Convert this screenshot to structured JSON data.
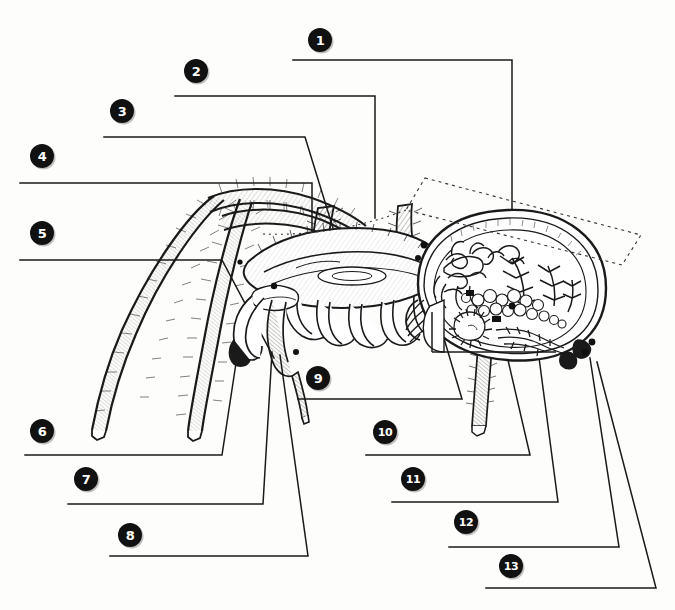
{
  "page": {
    "kind": "anatomy-worksheet",
    "background_color": "#fdfdfc",
    "ink_color": "#111111",
    "width": 675,
    "height": 610
  },
  "markers": [
    {
      "id": 1,
      "label": "1",
      "x": 320,
      "y": 40,
      "line": {
        "x1": 293,
        "x2": 512,
        "y": 60,
        "vx": 512,
        "vy": 245
      }
    },
    {
      "id": 2,
      "label": "2",
      "x": 196,
      "y": 71,
      "line": {
        "x1": 175,
        "x2": 375,
        "y": 96,
        "vx": 375,
        "vy": 218
      }
    },
    {
      "id": 3,
      "label": "3",
      "x": 122,
      "y": 111,
      "line": {
        "x1": 104,
        "x2": 305,
        "y": 137,
        "vx": 333,
        "vy": 228
      }
    },
    {
      "id": 4,
      "label": "4",
      "x": 42,
      "y": 156,
      "line": {
        "x1": 20,
        "x2": 312,
        "y": 183,
        "vx": 312,
        "vy": 232
      }
    },
    {
      "id": 5,
      "label": "5",
      "x": 42,
      "y": 233,
      "line": {
        "x1": 20,
        "x2": 222,
        "y": 260,
        "vx": 274,
        "vy": 358
      }
    },
    {
      "id": 6,
      "label": "6",
      "x": 42,
      "y": 431,
      "line": {
        "x1": 25,
        "x2": 222,
        "y": 455,
        "vx": 238,
        "vy": 350
      }
    },
    {
      "id": 7,
      "label": "7",
      "x": 86,
      "y": 479,
      "line": {
        "x1": 68,
        "x2": 263,
        "y": 504,
        "vx": 272,
        "vy": 352
      }
    },
    {
      "id": 8,
      "label": "8",
      "x": 130,
      "y": 535,
      "line": {
        "x1": 110,
        "x2": 308,
        "y": 556,
        "vx": 280,
        "vy": 355
      }
    },
    {
      "id": 9,
      "label": "9",
      "x": 318,
      "y": 378,
      "line": {
        "x1": 298,
        "x2": 462,
        "y": 399,
        "vx": 426,
        "vy": 278
      }
    },
    {
      "id": 10,
      "label": "10",
      "x": 385,
      "y": 432,
      "line": {
        "x1": 366,
        "x2": 530,
        "y": 455,
        "vx": 505,
        "vy": 347
      },
      "wide": true
    },
    {
      "id": 11,
      "label": "11",
      "x": 413,
      "y": 479,
      "line": {
        "x1": 392,
        "x2": 558,
        "y": 502,
        "vx": 538,
        "vy": 350
      },
      "wide": true
    },
    {
      "id": 12,
      "label": "12",
      "x": 466,
      "y": 522,
      "line": {
        "x1": 449,
        "x2": 619,
        "y": 547,
        "vx": 590,
        "vy": 358
      },
      "wide": true
    },
    {
      "id": 13,
      "label": "13",
      "x": 511,
      "y": 566,
      "line": {
        "x1": 486,
        "x2": 656,
        "y": 588,
        "vx": 597,
        "vy": 362
      },
      "wide": true
    }
  ],
  "illustration": {
    "dashed_overlay": "sectioning-plane-parallelogram",
    "parts": [
      "walking-legs",
      "pedipalp",
      "chelicera",
      "cephalothorax",
      "abdomen-cross-section",
      "heart",
      "digestive-gland",
      "book-lung",
      "spinnerets",
      "silk-glands",
      "ovary",
      "gut-diverticula",
      "sucking-stomach",
      "nerve-ganglion"
    ]
  }
}
